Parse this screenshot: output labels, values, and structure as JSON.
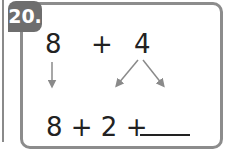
{
  "problem": {
    "number": "20.",
    "top_left": "8",
    "operator": "+",
    "top_right": "4",
    "expression": "8 + 2 +",
    "answer_blank": ""
  },
  "colors": {
    "badge": "#6e6e6e",
    "border": "#8c8c8c",
    "arrow": "#8a8a8a",
    "text": "#222222"
  }
}
